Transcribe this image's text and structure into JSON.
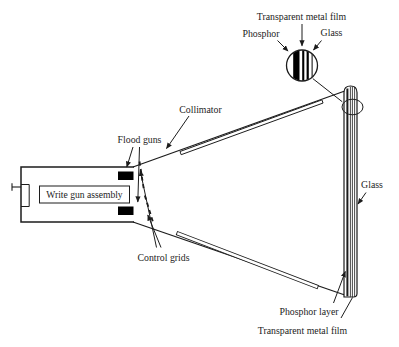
{
  "labels": {
    "transparent_metal_film_top": "Transparent metal film",
    "phosphor": "Phosphor",
    "glass_top": "Glass",
    "collimator": "Collimator",
    "flood_guns": "Flood guns",
    "write_gun_assembly": "Write gun assembly",
    "control_grids": "Control grids",
    "glass_right": "Glass",
    "phosphor_layer": "Phosphor layer",
    "transparent_metal_film_bottom": "Transparent metal film"
  },
  "colors": {
    "background": "#ffffff",
    "line": "#1c1c1c",
    "solid_fill": "#000000"
  }
}
